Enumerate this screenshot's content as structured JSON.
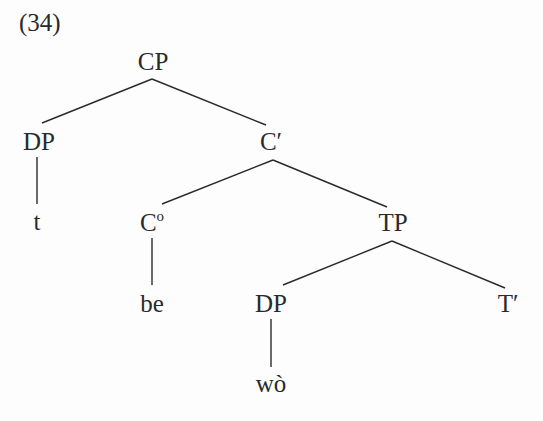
{
  "example_number": "(34)",
  "colors": {
    "ink": "#2a2a2a",
    "background": "#fdfdfd"
  },
  "tree": {
    "nodes": {
      "cp": {
        "label": "CP",
        "x": 153,
        "y": 49
      },
      "dp1": {
        "label": "DP",
        "x": 39,
        "y": 129
      },
      "t": {
        "label": "t",
        "x": 37,
        "y": 209
      },
      "cbar": {
        "label": "C′",
        "x": 271,
        "y": 129
      },
      "c0": {
        "label": "C",
        "sup": "o",
        "x": 152,
        "y": 210
      },
      "be": {
        "label": "be",
        "x": 152,
        "y": 291
      },
      "tp": {
        "label": "TP",
        "x": 393,
        "y": 210
      },
      "dp2": {
        "label": "DP",
        "x": 271,
        "y": 291
      },
      "tbar": {
        "label": "T′",
        "x": 508,
        "y": 291
      },
      "wo": {
        "label": "wò",
        "x": 271,
        "y": 371
      }
    },
    "edges": [
      {
        "from": "cp",
        "to": "dp1",
        "x1": 152,
        "y1": 79,
        "x2": 42,
        "y2": 123
      },
      {
        "from": "cp",
        "to": "cbar",
        "x1": 152,
        "y1": 79,
        "x2": 266,
        "y2": 125
      },
      {
        "from": "dp1",
        "to": "t",
        "x1": 37,
        "y1": 157,
        "x2": 37,
        "y2": 204
      },
      {
        "from": "cbar",
        "to": "c0",
        "x1": 273,
        "y1": 160,
        "x2": 162,
        "y2": 204
      },
      {
        "from": "cbar",
        "to": "tp",
        "x1": 273,
        "y1": 160,
        "x2": 387,
        "y2": 207
      },
      {
        "from": "c0",
        "to": "be",
        "x1": 152,
        "y1": 238,
        "x2": 152,
        "y2": 285
      },
      {
        "from": "tp",
        "to": "dp2",
        "x1": 392,
        "y1": 241,
        "x2": 283,
        "y2": 285
      },
      {
        "from": "tp",
        "to": "tbar",
        "x1": 392,
        "y1": 241,
        "x2": 505,
        "y2": 288
      },
      {
        "from": "dp2",
        "to": "wo",
        "x1": 271,
        "y1": 319,
        "x2": 271,
        "y2": 367
      }
    ]
  }
}
